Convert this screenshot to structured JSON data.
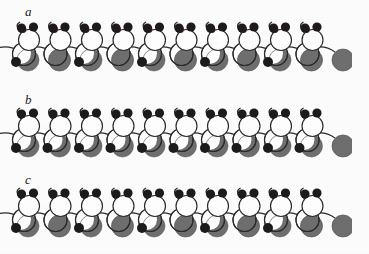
{
  "figure": {
    "type": "scientific-schematic",
    "background_color": "#fdfdfd",
    "width": 369,
    "height": 254
  },
  "colors": {
    "outline": "#2b2b2b",
    "black_dot": "#1c1c1c",
    "red_dot": "#5e1016",
    "gray_fill": "#6f6f6f",
    "gray_dark": "#565656",
    "open_circle_fill": "#ffffff",
    "label_color": "#1a1a1a",
    "page_background": "#fdfdfd"
  },
  "panels": [
    {
      "id": "a",
      "label": "a",
      "label_x": 25,
      "label_y": 4,
      "top": 18,
      "height": 68,
      "unit_count": 10,
      "has_red_dots": true,
      "lower_pattern": "alternating",
      "lower_first": "crescent",
      "description": "Chain with dark red marker dots beside the upper left black dot of each unit; lower gray bodies alternate between crescent-with-dot and full disc"
    },
    {
      "id": "b",
      "label": "b",
      "label_x": 25,
      "label_y": 92,
      "top": 104,
      "height": 66,
      "unit_count": 10,
      "has_red_dots": false,
      "lower_pattern": "uniform",
      "lower_first": "crescent",
      "description": "Chain with no red markers; every unit shows a black dot with a gray crescent body"
    },
    {
      "id": "c",
      "label": "c",
      "label_x": 25,
      "label_y": 172,
      "top": 184,
      "height": 66,
      "unit_count": 10,
      "has_red_dots": false,
      "lower_pattern": "alternating",
      "lower_first": "crescent",
      "description": "Chain with no red markers; lower gray bodies alternate between crescent-with-dot and full disc"
    }
  ],
  "unit_geometry": {
    "pitch": 31.5,
    "start_x": 24,
    "backbone_upper_radius": 10.5,
    "backbone_lower_radius": 11.5,
    "upper_circle_dy": 22,
    "lower_circle_dy": 36,
    "ear_radius": 4.6,
    "ear_left_dx": -7.5,
    "ear_right_dx": 4.5,
    "ear_dy": 12,
    "red_dot_radius": 3.4,
    "red_dot_dx": -8.5,
    "red_dot_dy": 14.5,
    "base_dot_radius": 5.0,
    "base_dot_dx": -8,
    "base_dot_dy": 44,
    "gray_disc_radius": 11.0,
    "gray_disc_dx": 4,
    "gray_disc_dy": 42
  },
  "chart_data": {
    "type": "schematic",
    "title": "",
    "series": [
      {
        "name": "a",
        "unit_count": 10,
        "marker": "red",
        "alternating_lower": true
      },
      {
        "name": "b",
        "unit_count": 10,
        "marker": "none",
        "alternating_lower": false
      },
      {
        "name": "c",
        "unit_count": 10,
        "marker": "none",
        "alternating_lower": true
      }
    ],
    "legend_entries": [
      "a",
      "b",
      "c"
    ]
  }
}
